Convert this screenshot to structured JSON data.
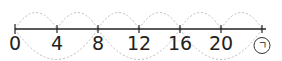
{
  "number_line": {
    "start": 0,
    "step": 4,
    "labels": [
      "0",
      "4",
      "8",
      "12",
      "16",
      "20"
    ],
    "unknown_label": "ㄱ",
    "tick_x": [
      15,
      57,
      98,
      139,
      180,
      221,
      262
    ],
    "line_color": "#222222",
    "arc_color": "#bbbbbb"
  }
}
